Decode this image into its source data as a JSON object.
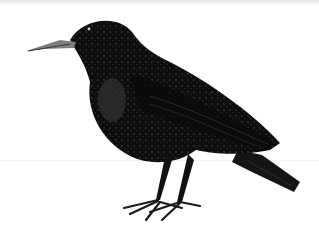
{
  "image": {
    "subject": "starling illustration",
    "background_color": "#ffffff",
    "body_color": "#0d0d0d",
    "speckle_color": "#5a5a5a",
    "beak_color": "#8a8a8a"
  }
}
